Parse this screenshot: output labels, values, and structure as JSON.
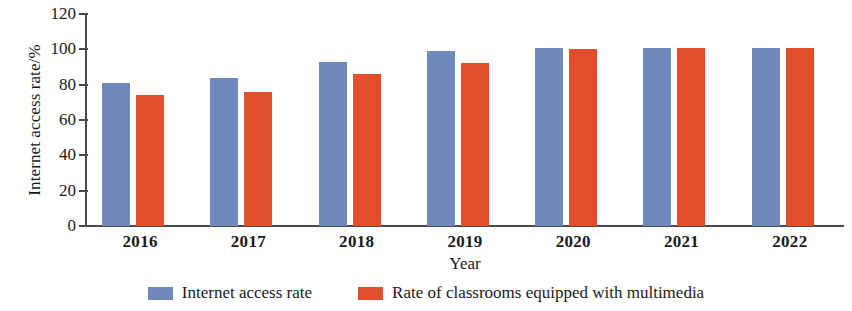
{
  "chart_data": {
    "type": "bar",
    "title": "",
    "xlabel": "Year",
    "ylabel": "Internet access rate/%",
    "categories": [
      "2016",
      "2017",
      "2018",
      "2019",
      "2020",
      "2021",
      "2022"
    ],
    "series": [
      {
        "name": "Internet access rate",
        "color": "#7089bd",
        "values": [
          81,
          84,
          93,
          99,
          101,
          101,
          101
        ]
      },
      {
        "name": "Rate of classrooms equipped with multimedia",
        "color": "#e04e2a",
        "values": [
          74,
          76,
          86,
          92,
          100,
          101,
          101
        ]
      }
    ],
    "ylim": [
      0,
      120
    ],
    "ytick_step": 20,
    "yticks": [
      "120",
      "100",
      "80",
      "60",
      "40",
      "20",
      "0"
    ],
    "grid": false,
    "legend_position": "bottom"
  },
  "legend": {
    "items": [
      {
        "label": "Internet access rate",
        "color": "#7089bd"
      },
      {
        "label": "Rate of classrooms equipped with multimedia",
        "color": "#e04e2a"
      }
    ]
  }
}
